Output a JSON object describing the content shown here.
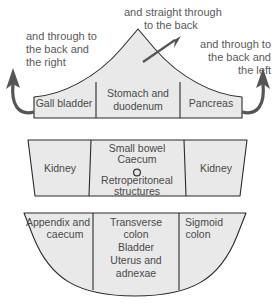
{
  "diagram": {
    "colors": {
      "band_fill": "#e9e9e9",
      "band_stroke": "#2b2b2b",
      "arrow": "#555555",
      "label_text": "#4a4a4a",
      "annotation_text": "#5a5a5a",
      "background": "#ffffff"
    },
    "annotations": [
      {
        "name": "annotation-top-left",
        "align": "left",
        "lines": [
          "and through to",
          "the back and",
          "the right"
        ]
      },
      {
        "name": "annotation-top-center",
        "align": "center",
        "lines": [
          "and straight through",
          "to the back"
        ]
      },
      {
        "name": "annotation-top-right",
        "align": "right",
        "lines": [
          "and through to",
          "the back and",
          "the left"
        ]
      }
    ],
    "bands": [
      {
        "name": "upper-band",
        "shape": "peaked-arch",
        "cells": [
          {
            "name": "cell-gall-bladder",
            "lines": [
              "Gall bladder"
            ]
          },
          {
            "name": "cell-stomach-duodenum",
            "lines": [
              "Stomach and",
              "duodenum"
            ]
          },
          {
            "name": "cell-pancreas",
            "lines": [
              "Pancreas"
            ]
          }
        ]
      },
      {
        "name": "middle-band",
        "shape": "trapezoid",
        "cells": [
          {
            "name": "cell-kidney-left",
            "lines": [
              "Kidney"
            ]
          },
          {
            "name": "cell-small-bowel",
            "lines": [
              "Small bowel",
              "Caecum",
              "○",
              "Retroperitoneal",
              "structures"
            ],
            "marker": "umbilicus-circle"
          },
          {
            "name": "cell-kidney-right",
            "lines": [
              "Kidney"
            ]
          }
        ]
      },
      {
        "name": "lower-band",
        "shape": "concave-bottom",
        "cells": [
          {
            "name": "cell-appendix-caecum",
            "lines": [
              "Appendix and",
              "caecum"
            ],
            "align": "right"
          },
          {
            "name": "cell-transverse-colon",
            "lines": [
              "Transverse",
              "colon",
              "Bladder",
              "Uterus and",
              "adnexae"
            ]
          },
          {
            "name": "cell-sigmoid-colon",
            "lines": [
              "Sigmoid",
              "colon"
            ],
            "align": "left"
          }
        ]
      }
    ],
    "arrows": [
      {
        "name": "arrow-left-curved",
        "direction": "up-left"
      },
      {
        "name": "arrow-center-diagonal",
        "direction": "up-right"
      },
      {
        "name": "arrow-right-curved",
        "direction": "up-right"
      }
    ]
  }
}
